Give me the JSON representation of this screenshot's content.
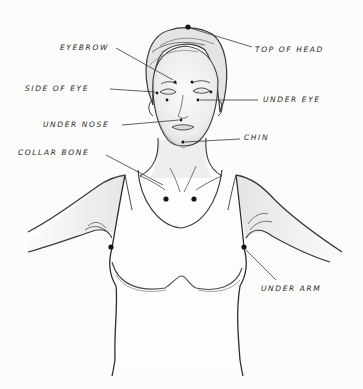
{
  "diagram": {
    "colors": {
      "background": "#fcfcfb",
      "ink": "#2a2a2a",
      "point": "#151515",
      "shade": "#d9d9d9"
    },
    "labels": [
      {
        "id": "top-of-head",
        "text": "TOP OF HEAD",
        "x": 255,
        "y": 46
      },
      {
        "id": "eyebrow",
        "text": "EYEBROW",
        "x": 60,
        "y": 44
      },
      {
        "id": "side-of-eye",
        "text": "SIDE OF EYE",
        "x": 25,
        "y": 85
      },
      {
        "id": "under-eye",
        "text": "UNDER EYE",
        "x": 263,
        "y": 96
      },
      {
        "id": "under-nose",
        "text": "UNDER NOSE",
        "x": 43,
        "y": 121
      },
      {
        "id": "chin",
        "text": "CHIN",
        "x": 244,
        "y": 134
      },
      {
        "id": "collar-bone",
        "text": "COLLAR BONE",
        "x": 18,
        "y": 149
      },
      {
        "id": "under-arm",
        "text": "UNDER ARM",
        "x": 261,
        "y": 285
      }
    ],
    "points": [
      {
        "id": "top-of-head",
        "x": 188,
        "y": 27
      },
      {
        "id": "eyebrow-left",
        "x": 175,
        "y": 82
      },
      {
        "id": "eyebrow-right",
        "x": 192,
        "y": 82
      },
      {
        "id": "side-of-eye-left",
        "x": 157,
        "y": 93
      },
      {
        "id": "side-of-eye-right",
        "x": 211,
        "y": 92
      },
      {
        "id": "under-eye-left",
        "x": 167,
        "y": 100
      },
      {
        "id": "under-eye-right",
        "x": 198,
        "y": 100
      },
      {
        "id": "under-nose",
        "x": 181,
        "y": 120
      },
      {
        "id": "chin",
        "x": 183,
        "y": 142
      },
      {
        "id": "collar-bone-left",
        "x": 166,
        "y": 199
      },
      {
        "id": "collar-bone-right",
        "x": 194,
        "y": 199
      },
      {
        "id": "under-arm-left",
        "x": 111,
        "y": 247
      },
      {
        "id": "under-arm-right",
        "x": 244,
        "y": 247
      }
    ],
    "leaders": [
      {
        "id": "top-of-head",
        "x1": 190,
        "y1": 28,
        "x2": 252,
        "y2": 47
      },
      {
        "id": "eyebrow",
        "x1": 116,
        "y1": 48,
        "x2": 173,
        "y2": 80
      },
      {
        "id": "side-of-eye",
        "x1": 110,
        "y1": 89,
        "x2": 155,
        "y2": 92
      },
      {
        "id": "under-eye",
        "x1": 200,
        "y1": 100,
        "x2": 258,
        "y2": 100
      },
      {
        "id": "under-nose",
        "x1": 122,
        "y1": 125,
        "x2": 179,
        "y2": 120
      },
      {
        "id": "chin",
        "x1": 185,
        "y1": 142,
        "x2": 240,
        "y2": 139
      },
      {
        "id": "collar-bone",
        "x1": 106,
        "y1": 155,
        "x2": 163,
        "y2": 185
      },
      {
        "id": "under-arm",
        "x1": 246,
        "y1": 250,
        "x2": 276,
        "y2": 280
      }
    ]
  }
}
